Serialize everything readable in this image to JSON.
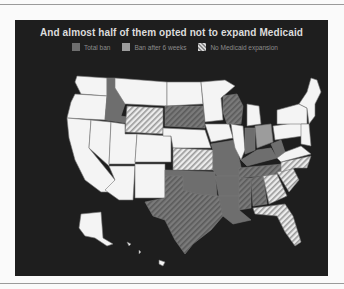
{
  "title": "And almost half of them opted not to expand Medicaid",
  "legend": [
    {
      "label": "Total ban",
      "swatch": "solid-dark-gray",
      "color": "#6e6e6e"
    },
    {
      "label": "Ban after 6 weeks",
      "swatch": "solid-light-gray",
      "color": "#9c9c9c"
    },
    {
      "label": "No Medicaid expansion",
      "swatch": "hatched",
      "color": "#d8d8d8"
    }
  ],
  "map": {
    "region": "United States",
    "states_total_ban": [
      "ID",
      "SD",
      "MO",
      "AR",
      "OK",
      "TX",
      "LA",
      "MS",
      "AL",
      "TN",
      "KY",
      "WI",
      "IN",
      "WV"
    ],
    "states_ban_after_6_weeks": [
      "OH",
      "GA",
      "SC"
    ],
    "states_no_medicaid_expansion": [
      "WY",
      "SD",
      "KS",
      "TX",
      "WI",
      "TN",
      "MS",
      "AL",
      "GA",
      "SC",
      "FL"
    ],
    "colors": {
      "background": "#1e1e1e",
      "state_default": "#f4f4f4",
      "state_border": "#777777",
      "total_ban": "#6e6e6e",
      "six_weeks": "#9c9c9c",
      "hatch_light": "#d8d8d8"
    }
  },
  "side_caption": ""
}
